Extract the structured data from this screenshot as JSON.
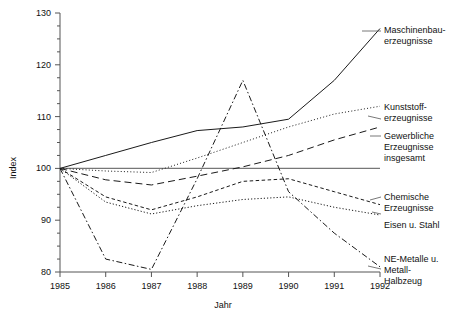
{
  "chart_data": {
    "type": "line",
    "title": "",
    "xlabel": "Jahr",
    "ylabel": "Index",
    "x": [
      1985,
      1986,
      1987,
      1988,
      1989,
      1990,
      1991,
      1992
    ],
    "categories": [
      "1985",
      "1986",
      "1987",
      "1988",
      "1989",
      "1990",
      "1991",
      "1992"
    ],
    "xlim": [
      1985,
      1992
    ],
    "ylim": [
      80,
      130
    ],
    "yticks": [
      80,
      90,
      100,
      110,
      120,
      130
    ],
    "yticklabels": [
      "80",
      "90",
      "100",
      "110",
      "120",
      "130"
    ],
    "yminor_step": 2.5,
    "grid": false,
    "legend_position": "right-inline-labels",
    "baseline": 100,
    "series": [
      {
        "name": "Maschinenbau-erzeugnisse",
        "style": "solid",
        "values": [
          100.0,
          102.5,
          105.0,
          107.3,
          108.0,
          109.5,
          117.0,
          127.0
        ]
      },
      {
        "name": "Kunststoff-erzeugnisse",
        "style": "dotted",
        "values": [
          100.0,
          99.5,
          99.2,
          102.0,
          105.0,
          108.0,
          110.5,
          112.0
        ]
      },
      {
        "name": "Gewerbliche Erzeugnisse insgesamt",
        "style": "dashed",
        "values": [
          100.0,
          97.8,
          96.8,
          98.5,
          100.3,
          102.5,
          105.5,
          108.0
        ]
      },
      {
        "name": "Chemische Erzeugnisse",
        "style": "dashed-short",
        "values": [
          100.0,
          94.5,
          92.0,
          94.5,
          97.5,
          98.0,
          95.5,
          93.0
        ]
      },
      {
        "name": "Eisen u. Stahl",
        "style": "dash-dot",
        "values": [
          100.0,
          93.5,
          91.2,
          92.8,
          94.0,
          94.5,
          92.5,
          91.0
        ]
      },
      {
        "name": "NE-Metalle u. Metall-Halbzeug",
        "style": "dash-dot-long",
        "values": [
          100.0,
          82.5,
          80.5,
          98.0,
          117.0,
          95.5,
          87.5,
          81.0
        ]
      }
    ]
  },
  "axes": {
    "y_label": "Index",
    "x_label": "Jahr",
    "y_ticks": [
      "130",
      "120",
      "110",
      "100",
      "90",
      "80"
    ],
    "x_ticks": [
      "1985",
      "1986",
      "1987",
      "1988",
      "1989",
      "1990",
      "1991",
      "1992"
    ]
  },
  "labels": {
    "maschinenbau_line1": "Maschinenbau-",
    "maschinenbau_line2": "erzeugnisse",
    "kunststoff_line1": "Kunststoff-",
    "kunststoff_line2": "erzeugnisse",
    "gewerbliche_line1": "Gewerbliche",
    "gewerbliche_line2": "Erzeugnisse",
    "gewerbliche_line3": "insgesamt",
    "chemische_line1": "Chemische",
    "chemische_line2": "Erzeugnisse",
    "eisen_line1": "Eisen u. Stahl",
    "nemetalle_line1": "NE-Metalle u.",
    "nemetalle_line2": "Metall-",
    "nemetalle_line3": "Halbzeug"
  },
  "colors": {
    "line": "#1a1a1a",
    "axis": "#555555",
    "baseline": "#777777",
    "background": "#ffffff"
  }
}
